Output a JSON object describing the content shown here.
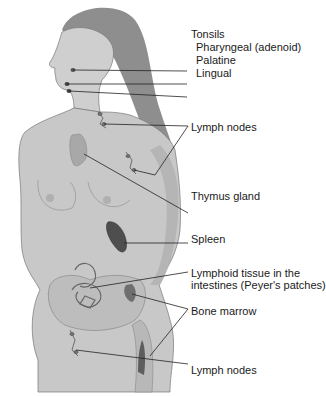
{
  "diagram": {
    "labels": {
      "tonsils_heading": "Tonsils",
      "pharyngeal": "Pharyngeal (adenoid)",
      "palatine": "Palatine",
      "lingual": "Lingual",
      "lymph_nodes_upper": "Lymph nodes",
      "thymus": "Thymus gland",
      "spleen": "Spleen",
      "peyers_line1": "Lymphoid tissue in the",
      "peyers_line2": "intestines (Peyer's patches)",
      "bone_marrow": "Bone marrow",
      "lymph_nodes_lower": "Lymph nodes"
    },
    "colors": {
      "skin": "#c9c9c9",
      "skin_shadow": "#a9a9a9",
      "hair": "#8a8a8a",
      "organ": "#5a5a5a",
      "leader_line": "#222222",
      "text": "#1a1a1a"
    }
  }
}
